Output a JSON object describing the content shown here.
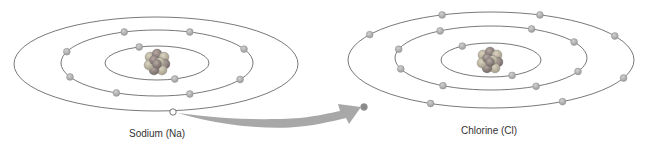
{
  "diagram": {
    "colors": {
      "orbit": "#555555",
      "electron": "#b8b8b8",
      "electron_vacancy": "#ffffff",
      "arrow": "#a8a8a8",
      "nucleus_proton": "#8c7f7a",
      "nucleus_neutron": "#b5ad98"
    },
    "atoms": [
      {
        "id": "sodium",
        "label": "Sodium (Na)",
        "shells": [
          {
            "shell": 1,
            "electrons": 2
          },
          {
            "shell": 2,
            "electrons": 8
          },
          {
            "shell": 3,
            "electrons": 1,
            "vacated": 1
          }
        ]
      },
      {
        "id": "chlorine",
        "label": "Chlorine (Cl)",
        "shells": [
          {
            "shell": 1,
            "electrons": 2
          },
          {
            "shell": 2,
            "electrons": 8
          },
          {
            "shell": 3,
            "electrons": 7
          }
        ]
      }
    ],
    "transfer": {
      "from": "sodium",
      "to": "chlorine",
      "electrons_transferred": 1
    }
  }
}
